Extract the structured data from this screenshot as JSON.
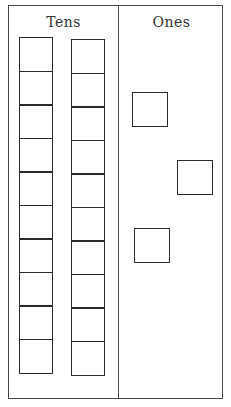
{
  "diagram": {
    "type": "place-value-chart",
    "columns": [
      {
        "label": "Tens",
        "rods": 2,
        "blocks_per_rod": 10
      },
      {
        "label": "Ones",
        "units": 3
      }
    ],
    "headings": {
      "tens": "Tens",
      "ones": "Ones"
    },
    "represented_value": 23,
    "colors": {
      "line": "#2a2a2a",
      "background": "#ffffff"
    }
  }
}
